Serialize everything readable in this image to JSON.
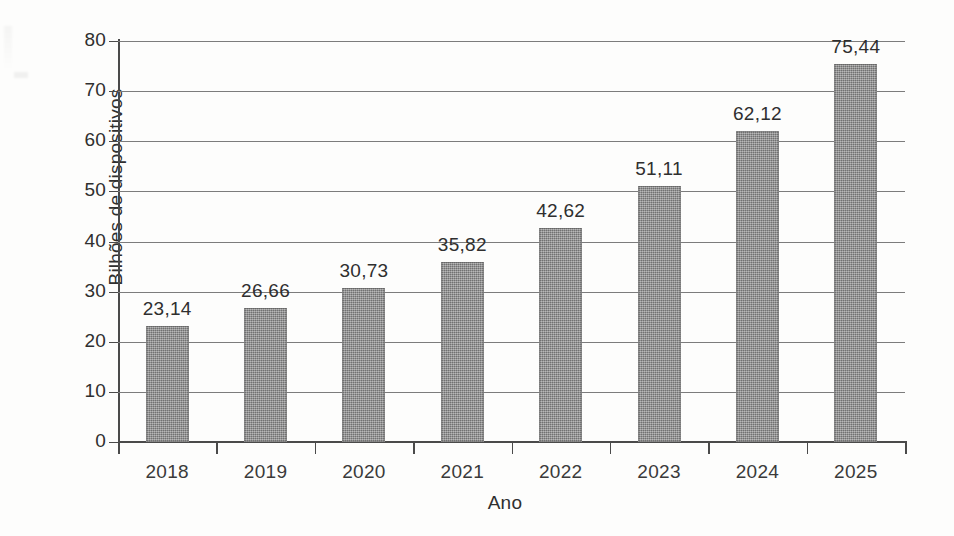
{
  "chart_data": {
    "type": "bar",
    "title": "",
    "subtitle": "",
    "xlabel": "Ano",
    "ylabel": "Bilhões de dispositivos",
    "categories": [
      "2018",
      "2019",
      "2020",
      "2021",
      "2022",
      "2023",
      "2024",
      "2025"
    ],
    "values": [
      23.14,
      26.66,
      30.73,
      35.82,
      42.62,
      51.11,
      62.12,
      75.44
    ],
    "value_labels": [
      "23,14",
      "26,66",
      "30,73",
      "35,82",
      "42,62",
      "51,11",
      "62,12",
      "75,44"
    ],
    "decimal_separator": ",",
    "ylim": [
      0,
      80
    ],
    "ytick_values": [
      0,
      10,
      20,
      30,
      40,
      50,
      60,
      70,
      80
    ],
    "ytick_labels": [
      "0",
      "10",
      "20",
      "30",
      "40",
      "50",
      "60",
      "70",
      "80"
    ],
    "grid": "horizontal",
    "legend": "none",
    "series": [
      {
        "name": "Bilhões de dispositivos",
        "values": [
          23.14,
          26.66,
          30.73,
          35.82,
          42.62,
          51.11,
          62.12,
          75.44
        ]
      }
    ],
    "colors": {
      "bar_fill": "#8c8c8c",
      "bar_edge": "#5a5a5a",
      "axis": "#4a4a4a",
      "gridline": "#7c7c7c",
      "text": "#2f2f2f",
      "background": "#fdfdfc"
    }
  }
}
